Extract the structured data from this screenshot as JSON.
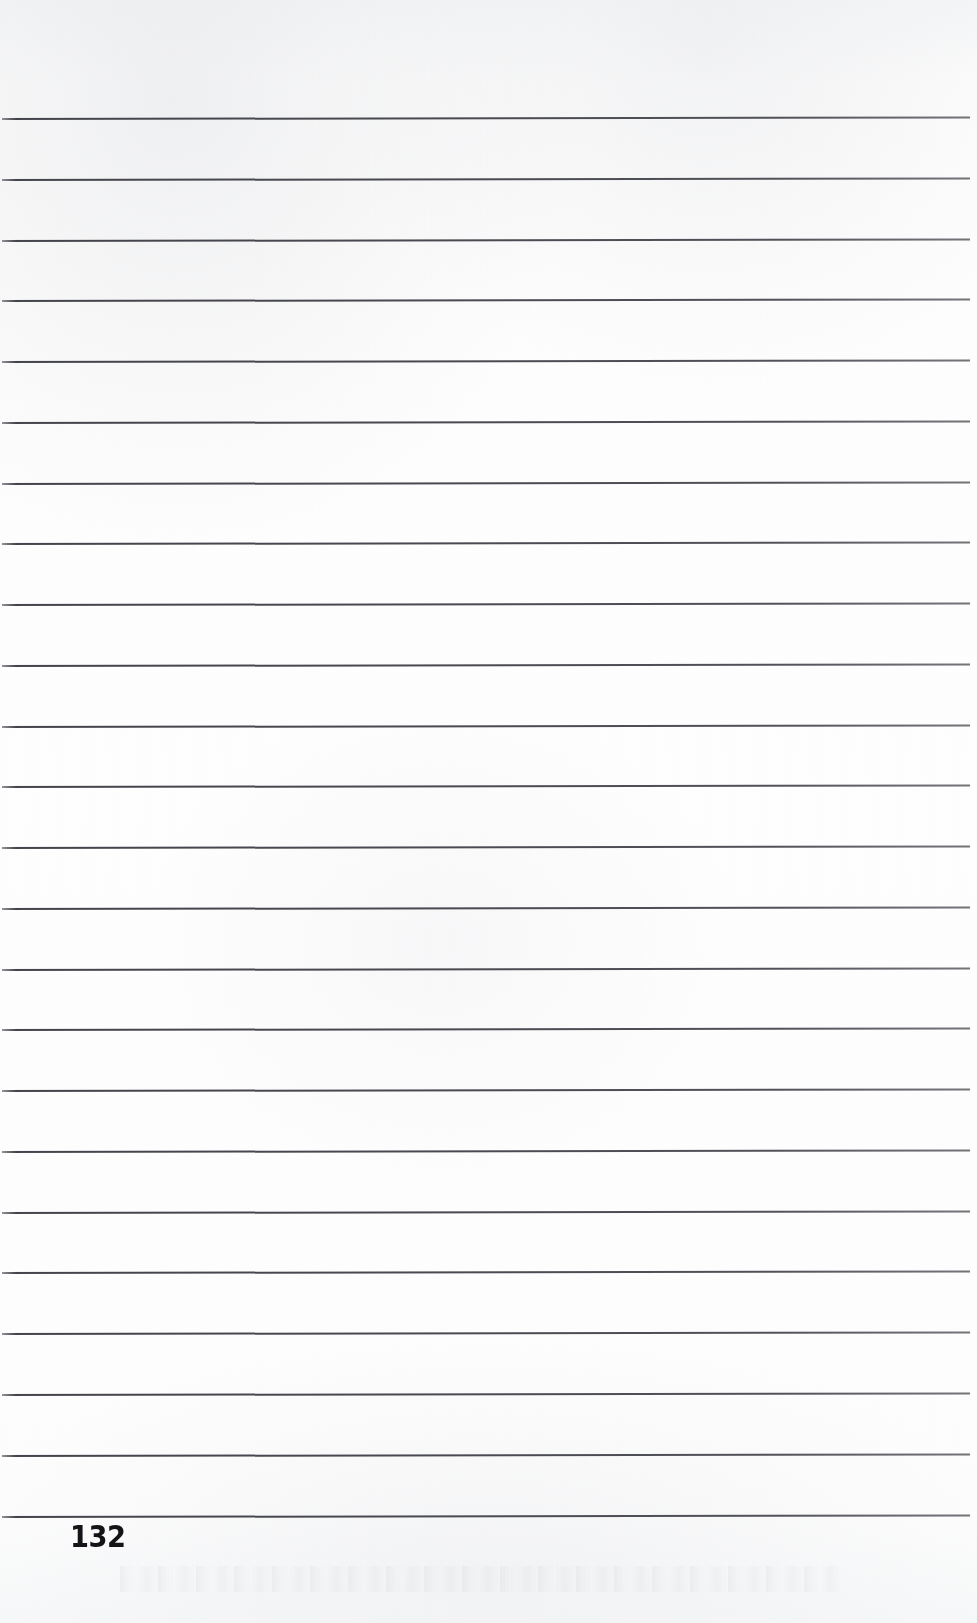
{
  "page": {
    "kind": "scanned-lined-notebook-page",
    "width": 977,
    "height": 1623,
    "background_color": "#fdfdfd",
    "page_number": "132",
    "page_number_color": "#131318"
  },
  "rules": {
    "count": 24,
    "color": "#3a3a42",
    "thickness_px": 2,
    "first_line_y": 118,
    "spacing_px": 60.8,
    "left_x": 2,
    "right_x": 970,
    "skew_deg": -0.085,
    "line_labels": [
      "rule-1",
      "rule-2",
      "rule-3",
      "rule-4",
      "rule-5",
      "rule-6",
      "rule-7",
      "rule-8",
      "rule-9",
      "rule-10",
      "rule-11",
      "rule-12",
      "rule-13",
      "rule-14",
      "rule-15",
      "rule-16",
      "rule-17",
      "rule-18",
      "rule-19",
      "rule-20",
      "rule-21",
      "rule-22",
      "rule-23",
      "rule-24"
    ],
    "line_y_positions": [
      118,
      179,
      240,
      300,
      361,
      422,
      483,
      543,
      604,
      665,
      726,
      786,
      847,
      908,
      969,
      1029,
      1090,
      1151,
      1212,
      1272,
      1333,
      1394,
      1455,
      1516
    ]
  },
  "content": {
    "body_text": "",
    "note": ""
  }
}
